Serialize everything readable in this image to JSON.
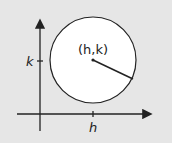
{
  "diagram": {
    "center_label": "(h,k)",
    "x_tick_label": "h",
    "y_tick_label": "k",
    "colors": {
      "background": "#e6e6e6",
      "circle_fill": "#ffffff",
      "stroke": "#222222"
    }
  }
}
